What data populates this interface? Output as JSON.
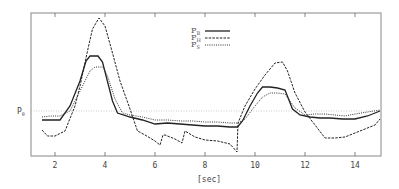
{
  "chart_data": {
    "type": "line",
    "title": "",
    "xlabel": "[sec]",
    "ylabel": "",
    "xlim": [
      1.04,
      15.04
    ],
    "ylim_note": "relative amplitude, P0 reference = 0 (pixel-derived units)",
    "ylim": [
      -45,
      98
    ],
    "xticks": [
      2,
      4,
      6,
      8,
      10,
      12,
      14
    ],
    "xtick_labels": [
      "2",
      "4",
      "6",
      "8",
      "10",
      "12",
      "14"
    ],
    "reference_line": {
      "label": "P",
      "subscript": "0",
      "value": 0,
      "style": "dotted"
    },
    "grid": false,
    "legend": {
      "position": "upper-center",
      "entries": [
        {
          "label": "P",
          "subscript": "B",
          "style": "solid"
        },
        {
          "label": "P",
          "subscript": "H",
          "style": "dashed"
        },
        {
          "label": "P",
          "subscript": "S",
          "style": "dotted"
        }
      ]
    },
    "series": [
      {
        "name": "P_B",
        "style": "solid",
        "x": [
          1.48,
          1.8,
          2.2,
          2.6,
          3.0,
          3.24,
          3.4,
          3.72,
          3.9,
          4.3,
          4.5,
          5.0,
          5.5,
          6.0,
          6.5,
          7.0,
          7.5,
          8.0,
          8.5,
          9.0,
          9.3,
          9.5,
          9.8,
          10.1,
          10.3,
          10.6,
          10.9,
          11.2,
          11.5,
          11.8,
          12.2,
          12.6,
          13.0,
          13.5,
          14.0,
          14.5,
          15.0
        ],
        "y": [
          -9,
          -9,
          -9,
          5,
          30,
          50,
          55,
          55,
          49,
          10,
          -2,
          -6,
          -9,
          -13,
          -12,
          -13,
          -14,
          -15,
          -15,
          -16,
          -16,
          -10,
          5,
          18,
          24,
          24,
          23,
          21,
          2,
          -4,
          -6,
          -7,
          -7,
          -8,
          -8,
          -5,
          0
        ]
      },
      {
        "name": "P_H",
        "style": "dashed",
        "x": [
          1.48,
          1.7,
          2.0,
          2.4,
          2.8,
          3.0,
          3.3,
          3.5,
          3.76,
          4.0,
          4.3,
          4.6,
          5.0,
          5.3,
          5.6,
          6.0,
          6.2,
          6.32,
          6.4,
          6.8,
          7.08,
          7.2,
          7.6,
          8.0,
          8.5,
          9.0,
          9.28,
          9.32,
          9.6,
          10.0,
          10.4,
          10.8,
          11.1,
          11.3,
          11.6,
          12.0,
          12.4,
          12.8,
          13.2,
          13.6,
          14.0,
          14.4,
          14.8,
          15.0
        ],
        "y": [
          -19,
          -25,
          -25,
          -20,
          5,
          25,
          60,
          82,
          93,
          85,
          58,
          30,
          2,
          -20,
          -24,
          -30,
          -34,
          -24,
          -24,
          -28,
          -32,
          -20,
          -26,
          -29,
          -30,
          -33,
          -41,
          -12,
          5,
          22,
          36,
          48,
          49,
          40,
          18,
          -1,
          -14,
          -27,
          -27,
          -26,
          -22,
          -18,
          -14,
          -8
        ]
      },
      {
        "name": "P_S",
        "style": "dotted",
        "x": [
          1.48,
          1.8,
          2.2,
          2.6,
          3.0,
          3.4,
          3.6,
          3.92,
          4.1,
          4.4,
          4.7,
          5.0,
          5.5,
          6.0,
          6.5,
          7.0,
          7.5,
          8.0,
          8.5,
          9.0,
          9.3,
          9.6,
          10.0,
          10.3,
          10.6,
          10.9,
          11.2,
          11.6,
          12.0,
          12.4,
          12.8,
          13.2,
          13.6,
          14.0,
          14.5,
          15.0
        ],
        "y": [
          -6,
          -5,
          -5,
          0,
          20,
          40,
          44,
          44,
          35,
          12,
          -2,
          -4,
          -6,
          -9,
          -9,
          -10,
          -10,
          -11,
          -11,
          -12,
          -12,
          -8,
          5,
          14,
          18,
          18,
          17,
          3,
          -4,
          -3,
          -3,
          -4,
          -5,
          -3,
          -1,
          1
        ]
      }
    ]
  },
  "axis": {
    "x_ticks": [
      {
        "label": "2",
        "px": 55
      },
      {
        "label": "4",
        "px": 105
      },
      {
        "label": "6",
        "px": 155
      },
      {
        "label": "8",
        "px": 205
      },
      {
        "label": "10",
        "px": 255
      },
      {
        "label": "12",
        "px": 305
      },
      {
        "label": "14",
        "px": 355
      }
    ],
    "x_label": "[sec]",
    "p0_label": "P",
    "p0_sub": "0"
  },
  "legend": {
    "b_label": "P",
    "b_sub": "B",
    "h_label": "P",
    "h_sub": "H",
    "s_label": "P",
    "s_sub": "S"
  },
  "colors": {
    "line": "#222222",
    "frame": "#777777",
    "reference": "#aaaaaa"
  }
}
